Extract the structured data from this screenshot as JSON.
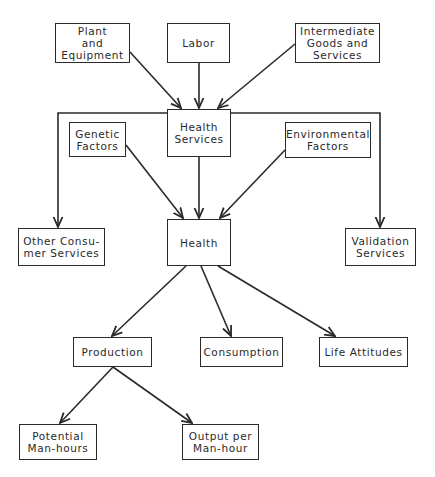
{
  "diagram": {
    "type": "flowchart",
    "colors": {
      "line": "#2a2a2a",
      "background": "#ffffff",
      "text": "#2a2a2a"
    },
    "nodes": {
      "plant": {
        "label": "Plant\nand\nEquipment"
      },
      "labor": {
        "label": "Labor"
      },
      "intermediate": {
        "label": "Intermediate\nGoods and\nServices"
      },
      "health_services": {
        "label": "Health\nServices"
      },
      "genetic": {
        "label": "Genetic\nFactors"
      },
      "environmental": {
        "label": "Environmental\nFactors"
      },
      "other_consumer": {
        "label": "Other Consu-\nmer Services"
      },
      "health": {
        "label": "Health"
      },
      "validation": {
        "label": "Validation\nServices"
      },
      "production": {
        "label": "Production"
      },
      "consumption": {
        "label": "Consumption"
      },
      "life_attitudes": {
        "label": "Life Attitudes"
      },
      "potential": {
        "label": "Potential\nMan-hours"
      },
      "output": {
        "label": "Output per\nMan-hour"
      }
    },
    "edges": [
      {
        "from": "Plant and Equipment",
        "to": "Health Services"
      },
      {
        "from": "Labor",
        "to": "Health Services"
      },
      {
        "from": "Intermediate Goods and Services",
        "to": "Health Services"
      },
      {
        "from": "Health Services",
        "to": "Other Consumer Services"
      },
      {
        "from": "Health Services",
        "to": "Validation Services"
      },
      {
        "from": "Health Services",
        "to": "Health"
      },
      {
        "from": "Genetic Factors",
        "to": "Health"
      },
      {
        "from": "Environmental Factors",
        "to": "Health"
      },
      {
        "from": "Health",
        "to": "Production"
      },
      {
        "from": "Health",
        "to": "Consumption"
      },
      {
        "from": "Health",
        "to": "Life Attitudes"
      },
      {
        "from": "Production",
        "to": "Potential Man-hours"
      },
      {
        "from": "Production",
        "to": "Output per Man-hour"
      }
    ]
  }
}
